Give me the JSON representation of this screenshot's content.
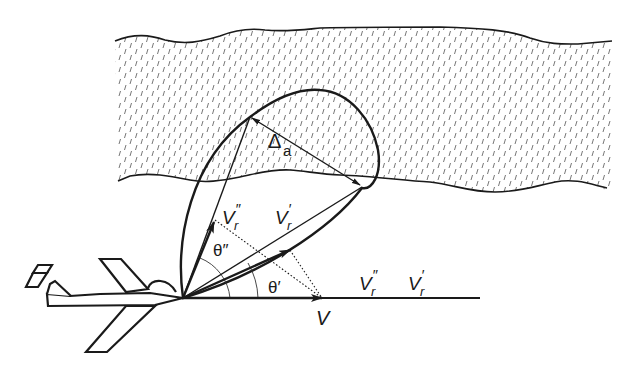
{
  "diagram": {
    "colors": {
      "stroke": "#1a1a1a",
      "hatch": "#555555",
      "background": "#ffffff"
    },
    "labels": {
      "delta": "Δ",
      "delta_sub": "a",
      "vr_double_prime_top": "V",
      "vr_double_prime_top_sub": "r",
      "vr_double_prime_top_mark": "″",
      "vr_prime_top": "V",
      "vr_prime_top_sub": "r",
      "vr_prime_top_mark": "′",
      "theta_double_prime": "θ″",
      "theta_prime": "θ′",
      "vr_double_prime_axis": "V",
      "vr_double_prime_axis_sub": "r",
      "vr_double_prime_axis_mark": "″",
      "vr_prime_axis": "V",
      "vr_prime_axis_sub": "r",
      "vr_prime_axis_mark": "′",
      "v": "V"
    },
    "elements": [
      "cloud-layer",
      "aircraft",
      "radiation-lobe",
      "velocity-vector-V",
      "relative-velocity-vector-Vr-prime",
      "relative-velocity-vector-Vr-double-prime",
      "angle-theta-prime",
      "angle-theta-double-prime",
      "projection-lines",
      "resolution-dimension-delta-a"
    ]
  }
}
